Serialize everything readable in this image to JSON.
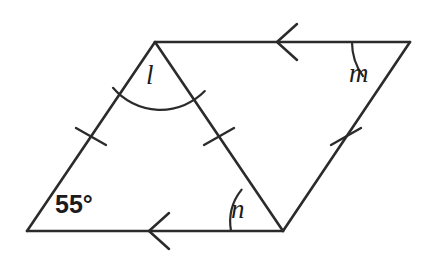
{
  "figure": {
    "stroke_color": "#2b2b2b",
    "background_color": "#ffffff",
    "stroke_width": 2.6,
    "vertices": {
      "bottom_left": {
        "x": 27,
        "y": 231
      },
      "apex_left": {
        "x": 155,
        "y": 42
      },
      "top_right": {
        "x": 410,
        "y": 42
      },
      "bottom_right": {
        "x": 283,
        "y": 231
      }
    },
    "edges": [
      {
        "name": "left-side",
        "from": "bottom_left",
        "to": "apex_left",
        "tick_marks": 1
      },
      {
        "name": "top-side",
        "from": "apex_left",
        "to": "top_right",
        "arrow_marks": 1
      },
      {
        "name": "right-side",
        "from": "top_right",
        "to": "bottom_right",
        "tick_marks": 1
      },
      {
        "name": "bottom-side",
        "from": "bottom_right",
        "to": "bottom_left",
        "arrow_marks": 1
      },
      {
        "name": "diagonal",
        "from": "apex_left",
        "to": "bottom_right",
        "tick_marks": 1
      }
    ],
    "tick_positions": [
      {
        "name": "left-side-tick",
        "x": 91,
        "y": 136
      },
      {
        "name": "diagonal-tick",
        "x": 219,
        "y": 136
      },
      {
        "name": "right-side-tick",
        "x": 346,
        "y": 136
      }
    ],
    "arrow_positions": [
      {
        "name": "top-side-arrow",
        "x": 283,
        "y": 42,
        "direction": "left"
      },
      {
        "name": "bottom-side-arrow",
        "x": 155,
        "y": 231,
        "direction": "left"
      }
    ]
  },
  "labels": {
    "angle_l": "l",
    "angle_m": "m",
    "angle_n": "n",
    "angle_measure": "55°"
  },
  "angles": {
    "l": {
      "vertex": "apex_left",
      "arc_radius": 62,
      "label": "l"
    },
    "m": {
      "vertex": "top_right",
      "arc_radius": 58,
      "label": "m"
    },
    "n": {
      "vertex": "bottom_right",
      "arc_radius": 52,
      "label": "n"
    },
    "known": {
      "vertex": "bottom_left",
      "label": "55°",
      "value": 55,
      "unit": "degrees"
    }
  }
}
